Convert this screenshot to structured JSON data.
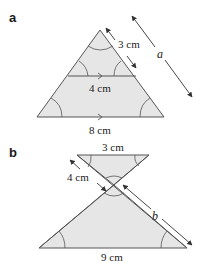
{
  "figure": {
    "colors": {
      "fill": "#e6e6e6",
      "stroke": "#555555",
      "text": "#222222",
      "background": "#ffffff"
    },
    "parts": [
      {
        "label": "a",
        "description": "Triangle with parallel line inside creating similar triangles",
        "measurements": {
          "side_small": "3 cm",
          "parallel_small": "4 cm",
          "base_large": "8 cm",
          "unknown": "a"
        }
      },
      {
        "label": "b",
        "description": "Two similar triangles meeting at a vertex (bow-tie)",
        "measurements": {
          "top_base": "3 cm",
          "side_small": "4 cm",
          "unknown": "b",
          "bottom_base": "9 cm"
        }
      }
    ]
  }
}
